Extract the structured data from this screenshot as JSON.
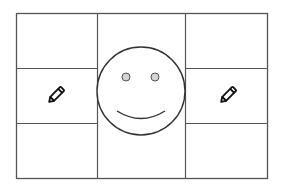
{
  "diagram": {
    "type": "grid-with-face",
    "grid": {
      "columns": 3,
      "rows": 3,
      "stroke_color": "#555555"
    },
    "center_figure": {
      "kind": "smiley-face",
      "stroke_color": "#333333",
      "eye_fill": "#d4d4d4"
    },
    "icons": [
      {
        "name": "pencil-icon",
        "position": "middle-left"
      },
      {
        "name": "pencil-icon",
        "position": "middle-right"
      }
    ]
  }
}
